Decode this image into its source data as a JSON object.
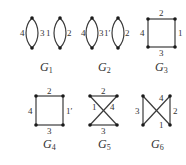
{
  "figure": {
    "graphs": [
      {
        "id": "G1",
        "name": "G",
        "sub": "1",
        "edge_labels": [
          "4",
          "3",
          "1",
          "2"
        ]
      },
      {
        "id": "G2",
        "name": "G",
        "sub": "2",
        "edge_labels": [
          "4",
          "3",
          "1′",
          "2"
        ]
      },
      {
        "id": "G3",
        "name": "G",
        "sub": "3",
        "edge_labels": [
          "2",
          "4",
          "1",
          "3"
        ]
      },
      {
        "id": "G4",
        "name": "G",
        "sub": "4",
        "edge_labels": [
          "2",
          "4",
          "1′",
          "3"
        ]
      },
      {
        "id": "G5",
        "name": "G",
        "sub": "5",
        "edge_labels": [
          "2",
          "1",
          "4",
          "3"
        ]
      },
      {
        "id": "G6",
        "name": "G",
        "sub": "6",
        "edge_labels": [
          "4",
          "3",
          "2",
          "1"
        ]
      }
    ],
    "colors": {
      "edge": "#3a3a3a",
      "vertex": "#1a1a1a",
      "text": "#333333",
      "background": "#ffffff"
    }
  }
}
